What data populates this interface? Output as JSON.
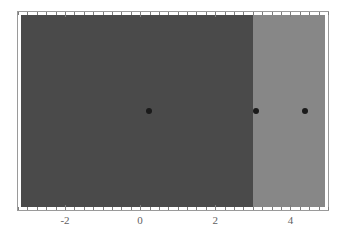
{
  "chart_data": {
    "type": "heatmap",
    "title": "",
    "xlabel": "",
    "ylabel": "",
    "xlim": [
      -3.25,
      5.0
    ],
    "ylim": [
      0,
      1
    ],
    "grid": false,
    "legend": null,
    "xticks_major": [
      -2,
      0,
      2,
      4
    ],
    "xtick_labels": [
      "-2",
      "0",
      "2",
      "4"
    ],
    "xtick_minor_step": 0.25,
    "yticks_major": [],
    "ytick_labels": [],
    "frame": true,
    "ticks_on_top": true,
    "regions": [
      {
        "name": "dark-region",
        "x_start": -3.25,
        "x_end": 3.05,
        "color": "#4a4a4a"
      },
      {
        "name": "light-region",
        "x_start": 3.05,
        "x_end": 5.0,
        "color": "#878787"
      }
    ],
    "points": [
      {
        "label": "point-1",
        "x": 0.22,
        "y": 0.5,
        "color": "#1a1a1a"
      },
      {
        "label": "point-2",
        "x": 3.12,
        "y": 0.5,
        "color": "#1a1a1a"
      },
      {
        "label": "point-3",
        "x": 4.45,
        "y": 0.5,
        "color": "#1a1a1a"
      }
    ],
    "colors": {
      "dark": "#4a4a4a",
      "light": "#878787",
      "marker": "#1a1a1a",
      "frame": "#9a9a9a",
      "tick": "#7d7d7d",
      "label": "#5f5f5f",
      "background": "#ffffff"
    }
  }
}
